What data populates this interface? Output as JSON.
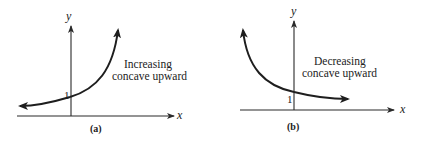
{
  "panels": [
    {
      "id": "a",
      "caption": "(a)",
      "x_label": "x",
      "y_label": "y",
      "intercept_label": "1",
      "annotation_line1": "Increasing",
      "annotation_line2": "concave upward",
      "curve": "exponential growth, arrow left and up"
    },
    {
      "id": "b",
      "caption": "(b)",
      "x_label": "x",
      "y_label": "y",
      "intercept_label": "1",
      "annotation_line1": "Decreasing",
      "annotation_line2": "concave upward",
      "curve": "exponential decay, arrow up-left and right"
    }
  ]
}
